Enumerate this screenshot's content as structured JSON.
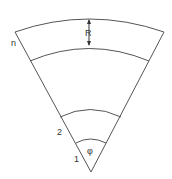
{
  "diagram": {
    "labels": {
      "outer_ring": "n",
      "radial_width": "R",
      "ring_2": "2",
      "ring_1": "1",
      "angle": "φ"
    },
    "stroke_color": "#555555",
    "background": "#ffffff"
  }
}
